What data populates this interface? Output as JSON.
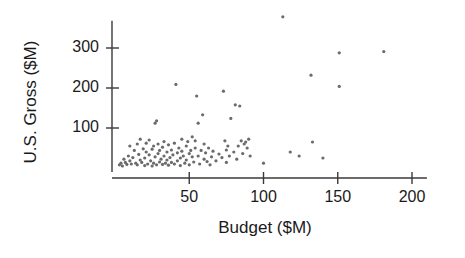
{
  "chart_data": {
    "type": "scatter",
    "title": "",
    "xlabel": "Budget ($M)",
    "ylabel": "U.S. Gross ($M)",
    "xlim": [
      0,
      210
    ],
    "ylim": [
      0,
      390
    ],
    "xticks": [
      50,
      100,
      150,
      200
    ],
    "yticks": [
      100,
      200,
      300
    ],
    "xtick_labels": [
      "50",
      "100",
      "150",
      "200"
    ],
    "ytick_labels": [
      "100",
      "200",
      "300"
    ],
    "grid": false,
    "legend": null,
    "marker_color": "#6b6b6b",
    "marker_size": 3.2,
    "axis_color": "#3a3a3a",
    "points": [
      [
        3,
        8
      ],
      [
        4,
        12
      ],
      [
        5,
        5
      ],
      [
        6,
        22
      ],
      [
        7,
        14
      ],
      [
        8,
        9
      ],
      [
        9,
        30
      ],
      [
        10,
        18
      ],
      [
        10,
        55
      ],
      [
        11,
        10
      ],
      [
        12,
        26
      ],
      [
        13,
        44
      ],
      [
        14,
        12
      ],
      [
        15,
        8
      ],
      [
        15,
        60
      ],
      [
        16,
        34
      ],
      [
        17,
        20
      ],
      [
        17,
        72
      ],
      [
        18,
        14
      ],
      [
        19,
        48
      ],
      [
        20,
        6
      ],
      [
        20,
        25
      ],
      [
        21,
        62
      ],
      [
        21,
        40
      ],
      [
        22,
        10
      ],
      [
        23,
        33
      ],
      [
        23,
        70
      ],
      [
        24,
        18
      ],
      [
        25,
        5
      ],
      [
        25,
        47
      ],
      [
        26,
        55
      ],
      [
        26,
        12
      ],
      [
        27,
        28
      ],
      [
        27,
        112
      ],
      [
        28,
        118
      ],
      [
        28,
        8
      ],
      [
        29,
        36
      ],
      [
        29,
        60
      ],
      [
        30,
        15
      ],
      [
        30,
        44
      ],
      [
        31,
        22
      ],
      [
        32,
        9
      ],
      [
        32,
        52
      ],
      [
        33,
        30
      ],
      [
        33,
        66
      ],
      [
        34,
        12
      ],
      [
        35,
        40
      ],
      [
        35,
        20
      ],
      [
        36,
        7
      ],
      [
        36,
        58
      ],
      [
        37,
        26
      ],
      [
        38,
        45
      ],
      [
        38,
        14
      ],
      [
        39,
        33
      ],
      [
        40,
        10
      ],
      [
        40,
        62
      ],
      [
        41,
        209
      ],
      [
        42,
        38
      ],
      [
        42,
        18
      ],
      [
        43,
        50
      ],
      [
        44,
        25
      ],
      [
        44,
        6
      ],
      [
        45,
        72
      ],
      [
        45,
        42
      ],
      [
        46,
        30
      ],
      [
        47,
        12
      ],
      [
        48,
        55
      ],
      [
        48,
        20
      ],
      [
        49,
        66
      ],
      [
        50,
        36
      ],
      [
        50,
        8
      ],
      [
        51,
        44
      ],
      [
        52,
        28
      ],
      [
        52,
        78
      ],
      [
        53,
        15
      ],
      [
        54,
        68
      ],
      [
        54,
        50
      ],
      [
        55,
        180
      ],
      [
        56,
        112
      ],
      [
        56,
        30
      ],
      [
        57,
        10
      ],
      [
        58,
        44
      ],
      [
        59,
        133
      ],
      [
        60,
        22
      ],
      [
        60,
        60
      ],
      [
        61,
        38
      ],
      [
        62,
        16
      ],
      [
        63,
        50
      ],
      [
        64,
        8
      ],
      [
        65,
        28
      ],
      [
        66,
        42
      ],
      [
        68,
        18
      ],
      [
        70,
        35
      ],
      [
        72,
        26
      ],
      [
        73,
        192
      ],
      [
        74,
        68
      ],
      [
        75,
        14
      ],
      [
        75,
        45
      ],
      [
        76,
        55
      ],
      [
        77,
        30
      ],
      [
        78,
        124
      ],
      [
        80,
        40
      ],
      [
        81,
        158
      ],
      [
        82,
        22
      ],
      [
        83,
        55
      ],
      [
        84,
        155
      ],
      [
        85,
        68
      ],
      [
        86,
        36
      ],
      [
        87,
        60
      ],
      [
        88,
        65
      ],
      [
        89,
        50
      ],
      [
        90,
        72
      ],
      [
        91,
        30
      ],
      [
        100,
        12
      ],
      [
        113,
        378
      ],
      [
        118,
        40
      ],
      [
        124,
        30
      ],
      [
        132,
        232
      ],
      [
        133,
        65
      ],
      [
        140,
        25
      ],
      [
        151,
        288
      ],
      [
        151,
        204
      ],
      [
        181,
        291
      ]
    ]
  },
  "figure": {
    "background": "#ffffff"
  }
}
